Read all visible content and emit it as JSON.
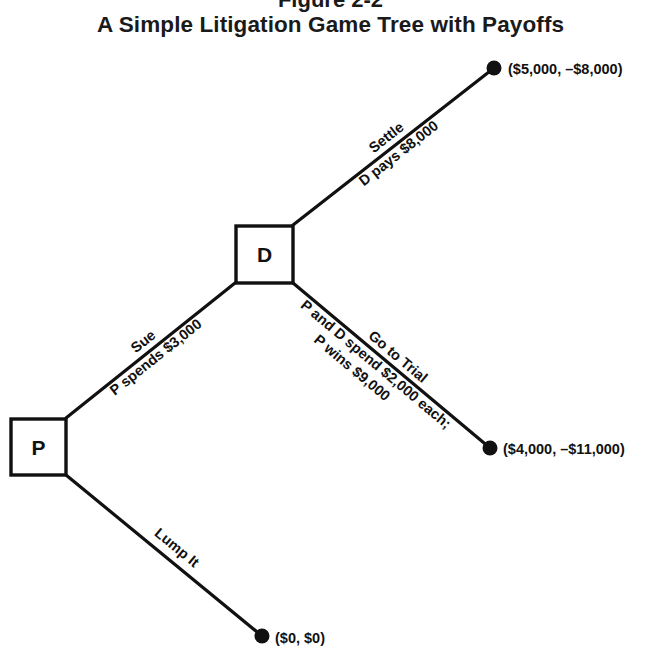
{
  "figure": {
    "label": "Figure 2-2",
    "title": "A Simple Litigation Game Tree with Payoffs"
  },
  "nodes": {
    "p": {
      "label": "P"
    },
    "d": {
      "label": "D"
    }
  },
  "edges": {
    "sue": {
      "action": "Sue",
      "detail": "P spends $3,000"
    },
    "lump_it": {
      "action": "Lump It"
    },
    "settle": {
      "action": "Settle",
      "detail": "D pays $8,000"
    },
    "trial": {
      "action": "Go to Trial",
      "detail1": "P and D spend $2,000 each;",
      "detail2": "P wins $9,000"
    }
  },
  "payoffs": {
    "settle": "($5,000, –$8,000)",
    "trial": "($4,000, –$11,000)",
    "lump_it": "($0, $0)"
  },
  "colors": {
    "ink": "#111111",
    "background": "#ffffff"
  }
}
